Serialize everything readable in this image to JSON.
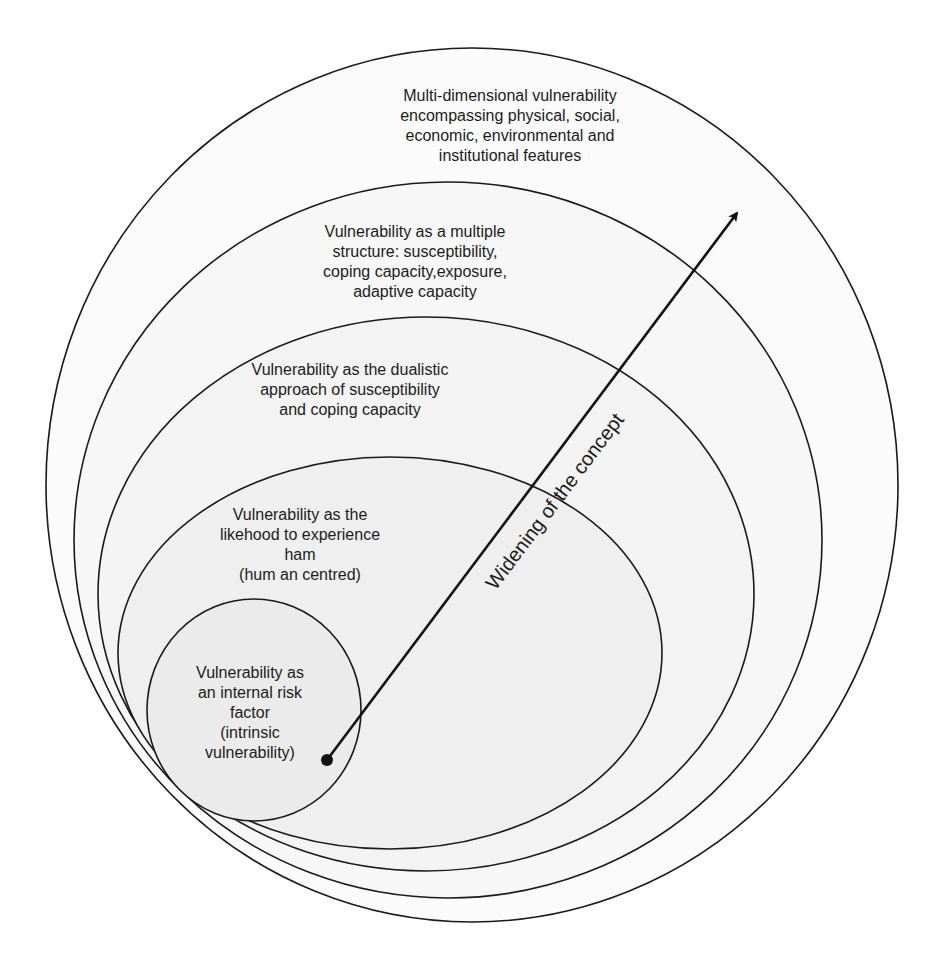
{
  "diagram": {
    "type": "nested-circles",
    "colors": {
      "line": "#1a1a1a",
      "fill_inner": "#ececec",
      "fill_mid": "#f2f2f2",
      "fill_outer": "#fafafa",
      "background": "#ffffff"
    },
    "levels": [
      {
        "id": 1,
        "text": "Vulnerability as\nan internal risk\nfactor\n(intrinsic\nvulnerability)"
      },
      {
        "id": 2,
        "text": "Vulnerability as the\nlikehood to experience\nham\n(hum an centred)"
      },
      {
        "id": 3,
        "text": "Vulnerability as the dualistic\napproach of susceptibility\nand coping capacity"
      },
      {
        "id": 4,
        "text": "Vulnerability as a multiple\nstructure: susceptibility,\ncoping capacity,exposure,\nadaptive capacity"
      },
      {
        "id": 5,
        "text": "Multi-dimensional vulnerability\nencompassing physical, social,\neconomic, environmental and\ninstitutional features"
      }
    ],
    "arrow": {
      "label": "Widening of the concept",
      "direction": "from innermost outward"
    }
  }
}
